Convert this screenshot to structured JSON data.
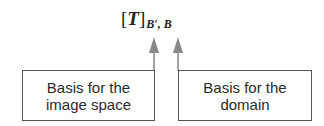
{
  "formula": {
    "open_bracket": "[",
    "symbol": "T",
    "close_bracket": "]",
    "subscript": "B′, B"
  },
  "boxes": [
    {
      "line1": "Basis for the",
      "line2": "image space"
    },
    {
      "line1": "Basis for the",
      "line2": "domain"
    }
  ],
  "colors": {
    "arrow": "#888888",
    "box_border": "#555555",
    "text": "#2a2a2a"
  }
}
